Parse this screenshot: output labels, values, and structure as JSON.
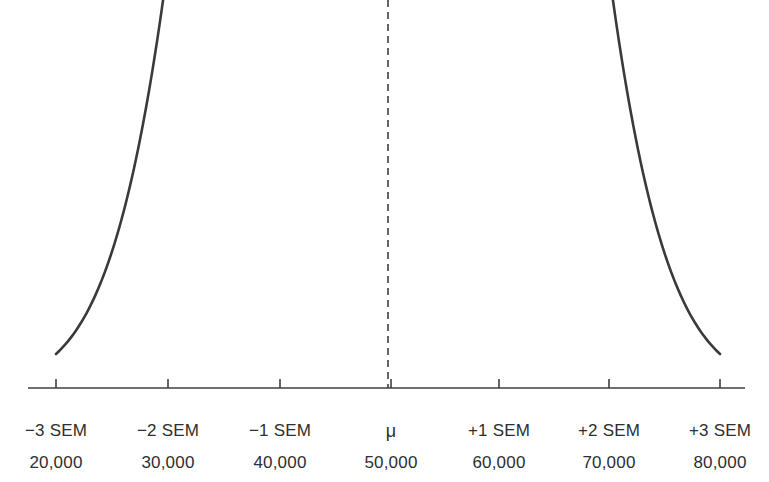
{
  "figure": {
    "kind": "normal-distribution-curve",
    "background_color": "#ffffff",
    "curve_color": "#3a3a3c",
    "axis_color": "#3f3f41",
    "text_color": "#2e2e30",
    "mean_line_style": "dashed"
  },
  "axis": {
    "line_y": 388,
    "line_x_start": 28,
    "line_x_end": 745,
    "tick_length": 9,
    "tick_positions_px": [
      56,
      168,
      280,
      391,
      499,
      609,
      720
    ]
  },
  "chart_data": {
    "type": "line",
    "title": "",
    "subtitle": "",
    "xlabel": "",
    "ylabel": "",
    "grid": false,
    "legend": "none",
    "distribution": "normal",
    "mean": 50000,
    "sem": 10000,
    "annotations": [
      {
        "name": "mean-dashed-line",
        "at_x": 50000,
        "label": "μ"
      }
    ],
    "sem_tick_labels": [
      "−3 SEM",
      "−2 SEM",
      "−1 SEM",
      "μ",
      "+1 SEM",
      "+2 SEM",
      "+3 SEM"
    ],
    "value_tick_labels": [
      "20,000",
      "30,000",
      "40,000",
      "50,000",
      "60,000",
      "70,000",
      "80,000"
    ],
    "x": [
      20000,
      30000,
      40000,
      50000,
      60000,
      70000,
      80000
    ],
    "z": [
      -3,
      -2,
      -1,
      0,
      1,
      2,
      3
    ],
    "values": [
      0.0111,
      0.1353,
      0.6065,
      1.0,
      0.6065,
      0.1353,
      0.0111
    ],
    "xlim": [
      20000,
      80000
    ],
    "ylim": [
      0,
      1.0
    ]
  },
  "labels": {
    "sem": [
      {
        "text": "−3 SEM",
        "x": 56
      },
      {
        "text": "−2 SEM",
        "x": 168
      },
      {
        "text": "−1 SEM",
        "x": 280
      },
      {
        "text": "μ",
        "x": 391
      },
      {
        "text": "+1 SEM",
        "x": 499
      },
      {
        "text": "+2 SEM",
        "x": 609
      },
      {
        "text": "+3 SEM",
        "x": 720
      }
    ],
    "values": [
      {
        "text": "20,000",
        "x": 56
      },
      {
        "text": "30,000",
        "x": 168
      },
      {
        "text": "40,000",
        "x": 280
      },
      {
        "text": "50,000",
        "x": 391
      },
      {
        "text": "60,000",
        "x": 499
      },
      {
        "text": "70,000",
        "x": 609
      },
      {
        "text": "80,000",
        "x": 720
      }
    ]
  }
}
